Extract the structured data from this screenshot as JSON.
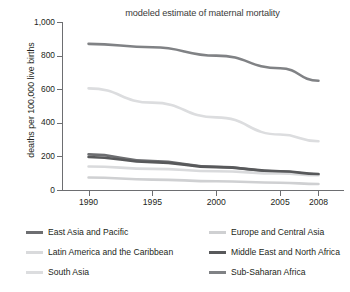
{
  "chart_data": {
    "type": "line",
    "title": "modeled estimate of maternal mortality",
    "xlabel": "",
    "ylabel": "deaths per 100,000 live births",
    "x": [
      1990,
      1995,
      2000,
      2005,
      2008
    ],
    "xtick_labels": [
      "1990",
      "1995",
      "2000",
      "2005",
      "2008"
    ],
    "xlim": [
      1988,
      2010
    ],
    "ylim": [
      0,
      1000
    ],
    "ytick_values": [
      0,
      200,
      400,
      600,
      800,
      1000
    ],
    "ytick_labels": [
      "0",
      "200",
      "400",
      "600",
      "800",
      "1,000"
    ],
    "grid": false,
    "legend_position": "below",
    "series": [
      {
        "name": "East Asia and Pacific",
        "color": "#6d6e71",
        "values": [
          212,
          172,
          138,
          110,
          92
        ]
      },
      {
        "name": "Europe and Central Asia",
        "color": "#cfd0d2",
        "values": [
          74,
          62,
          52,
          43,
          36
        ]
      },
      {
        "name": "Latin America and the Caribbean",
        "color": "#d9dadc",
        "values": [
          140,
          126,
          112,
          98,
          88
        ]
      },
      {
        "name": "Middle East and North Africa",
        "color": "#58595b",
        "values": [
          196,
          166,
          136,
          112,
          95
        ]
      },
      {
        "name": "South Asia",
        "color": "#dcdddf",
        "values": [
          605,
          520,
          432,
          330,
          290
        ]
      },
      {
        "name": "Sub-Saharan Africa",
        "color": "#808285",
        "values": [
          870,
          850,
          800,
          725,
          650
        ]
      }
    ]
  },
  "legend": {
    "items": [
      {
        "label": "East Asia and Pacific",
        "color": "#6d6e71",
        "col": "left",
        "row": 0
      },
      {
        "label": "Latin America and the Caribbean",
        "color": "#d9dadc",
        "col": "left",
        "row": 1
      },
      {
        "label": "South Asia",
        "color": "#dcdddf",
        "col": "left",
        "row": 2
      },
      {
        "label": "Europe and Central Asia",
        "color": "#cfd0d2",
        "col": "right",
        "row": 0
      },
      {
        "label": "Middle East and North Africa",
        "color": "#58595b",
        "col": "right",
        "row": 1
      },
      {
        "label": "Sub-Saharan Africa",
        "color": "#808285",
        "col": "right",
        "row": 2
      }
    ]
  }
}
